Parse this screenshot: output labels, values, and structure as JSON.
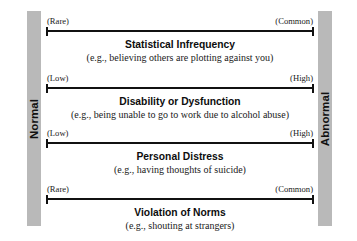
{
  "anchors": {
    "left": {
      "label": "Normal",
      "color": "#b9b9b9"
    },
    "right": {
      "label": "Abnormal",
      "color": "#b9b9b9"
    }
  },
  "criteria": [
    {
      "low_label": "(Rare)",
      "high_label": "(Common)",
      "title": "Statistical Infrequency",
      "example": "(e.g., believing others are plotting against you)"
    },
    {
      "low_label": "(Low)",
      "high_label": "(High)",
      "title": "Disability or Dysfunction",
      "example": "(e.g., being unable to go to work due to alcohol abuse)"
    },
    {
      "low_label": "(Low)",
      "high_label": "(High)",
      "title": "Personal Distress",
      "example": "(e.g., having thoughts of suicide)"
    },
    {
      "low_label": "(Rare)",
      "high_label": "(Common)",
      "title": "Violation of Norms",
      "example": "(e.g., shouting at strangers)"
    }
  ],
  "colors": {
    "line": "#111111",
    "text": "#1a1a1a",
    "background": "#ffffff"
  }
}
